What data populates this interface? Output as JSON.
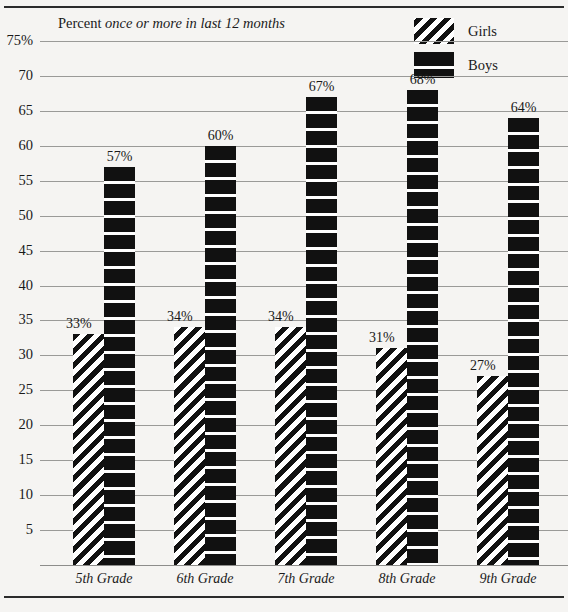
{
  "chart_data": {
    "type": "bar",
    "title": "Percent once or more in last 12 months",
    "title_plain": "Percent",
    "title_italic": "once or more in last 12 months",
    "xlabel": "",
    "ylabel": "",
    "categories": [
      "5th Grade",
      "6th Grade",
      "7th Grade",
      "8th Grade",
      "9th Grade"
    ],
    "series": [
      {
        "name": "Girls",
        "values": [
          33,
          34,
          34,
          31,
          27
        ],
        "pattern": "diagonal-hatch"
      },
      {
        "name": "Boys",
        "values": [
          57,
          60,
          67,
          68,
          64
        ],
        "pattern": "solid-black-striped"
      }
    ],
    "value_labels": {
      "Girls": [
        "33%",
        "34%",
        "34%",
        "31%",
        "27%"
      ],
      "Boys": [
        "57%",
        "60%",
        "67%",
        "68%",
        "64%"
      ]
    },
    "ylim": [
      0,
      75
    ],
    "ytick_values": [
      75,
      70,
      65,
      60,
      55,
      50,
      45,
      40,
      35,
      30,
      25,
      20,
      15,
      10,
      5
    ],
    "ytick_labels": [
      "75%",
      "70",
      "65",
      "60",
      "55",
      "50",
      "45",
      "40",
      "35",
      "30",
      "25",
      "20",
      "15",
      "10",
      "5"
    ],
    "grid": true,
    "legend_position": "top-right",
    "colors": {
      "ink": "#111111",
      "paper": "#f5f4f2",
      "gridline": "#9a9a98",
      "rule": "#2b2b2b"
    }
  },
  "legend": {
    "items": [
      {
        "label": "Girls",
        "swatch": "diagonal-hatch-swatch"
      },
      {
        "label": "Boys",
        "swatch": "solid-black-swatch"
      }
    ]
  }
}
